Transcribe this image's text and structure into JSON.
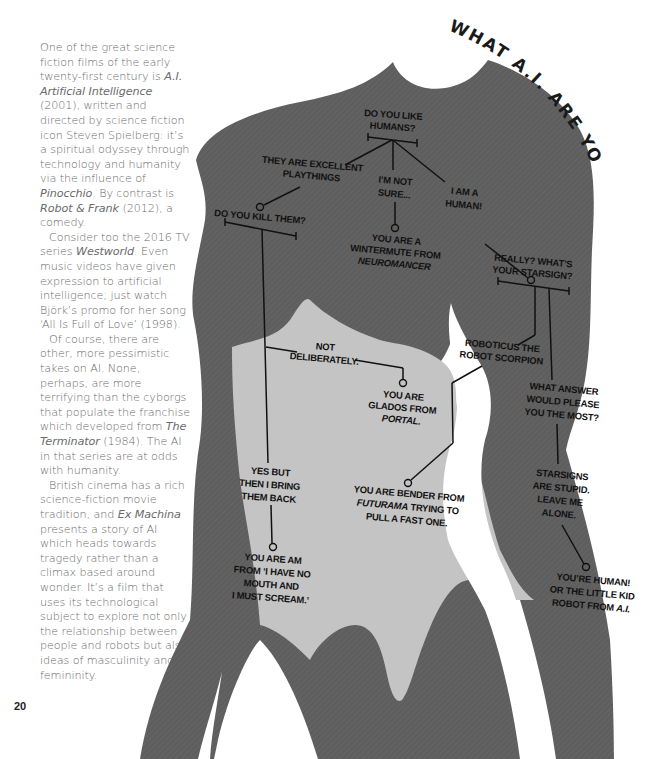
{
  "article": {
    "paragraphs": [
      {
        "indent": false,
        "segments": [
          {
            "text": "One of the great science fiction films of the early twenty-first century is "
          },
          {
            "text": "A.I. Artificial Intelligence",
            "italic": true
          },
          {
            "text": " (2001), written and directed by science fiction icon Steven Spielberg: it’s a spiritual odyssey through technology and humanity via the influence of "
          },
          {
            "text": "Pinocchio",
            "italic": true
          },
          {
            "text": ". By contrast is "
          },
          {
            "text": "Robot & Frank",
            "italic": true
          },
          {
            "text": " (2012), a comedy."
          }
        ]
      },
      {
        "indent": true,
        "segments": [
          {
            "text": "Consider too the 2016 TV series "
          },
          {
            "text": "Westworld",
            "italic": true
          },
          {
            "text": ". Even music videos have given expression to artificial intelligence; just watch Björk’s promo for her song ‘All Is Full of Love’ (1998)."
          }
        ]
      },
      {
        "indent": true,
        "segments": [
          {
            "text": "Of course, there are other, more pessimistic takes on AI. None, perhaps, are more terrifying than the cyborgs that populate the franchise which developed from "
          },
          {
            "text": "The Terminator",
            "italic": true
          },
          {
            "text": " (1984). The AI in that series are at odds with humanity."
          }
        ]
      },
      {
        "indent": true,
        "segments": [
          {
            "text": "British cinema has a rich science-fiction movie tradition, and "
          },
          {
            "text": "Ex Machina",
            "italic": true
          },
          {
            "text": " presents a story of AI which heads towards tragedy rather than a climax based around wonder. It’s a film that uses its technological subject to explore not only the relationship between people and robots but also ideas of masculinity and femininity."
          }
        ]
      }
    ],
    "page_number": "20"
  },
  "flowchart": {
    "title": "WHAT A.I. ARE YOU?",
    "colors": {
      "body_dark": "#5e5e5e",
      "body_light": "#c4c4c4",
      "ink": "#111111",
      "background": "#ffffff"
    },
    "nodes": {
      "start": [
        "DO YOU LIKE",
        "HUMANS?"
      ],
      "playthings": [
        "THEY ARE EXCELLENT",
        "PLAYTHINGS"
      ],
      "not_sure": [
        "I’M NOT",
        "SURE..."
      ],
      "human": [
        "I AM A",
        "HUMAN!"
      ],
      "kill": [
        "DO YOU KILL THEM?"
      ],
      "wintermute": [
        "YOU ARE A",
        "WINTERMUTE FROM"
      ],
      "wintermute_italic": "NEUROMANCER",
      "starsign": [
        "REALLY? WHAT’S",
        "YOUR STARSIGN?"
      ],
      "not_deliberately": [
        "NOT",
        "DELIBERATELY."
      ],
      "robotcus": [
        "ROBOTICUS THE",
        "ROBOT SCORPION"
      ],
      "glados": [
        "YOU ARE",
        "GLADOS FROM"
      ],
      "glados_italic": "PORTAL.",
      "please": [
        "WHAT ANSWER",
        "WOULD PLEASE",
        "YOU THE MOST?"
      ],
      "bring_back": [
        "YES BUT",
        "THEN I BRING",
        "THEM BACK"
      ],
      "bender_1": "YOU ARE BENDER FROM",
      "bender_italic": "FUTURAMA",
      "bender_2": " TRYING TO",
      "bender_3": "PULL A FAST ONE.",
      "stupid": [
        "STARSIGNS",
        "ARE STUPID.",
        "LEAVE ME",
        "ALONE."
      ],
      "am": [
        "YOU ARE AM",
        "FROM ‘I HAVE NO",
        "MOUTH AND",
        "I MUST SCREAM.’"
      ],
      "human_result_1": "YOU’RE HUMAN!",
      "human_result_2": "OR THE LITTLE KID",
      "human_result_3": "ROBOT FROM ",
      "human_result_italic": "A.I."
    }
  }
}
